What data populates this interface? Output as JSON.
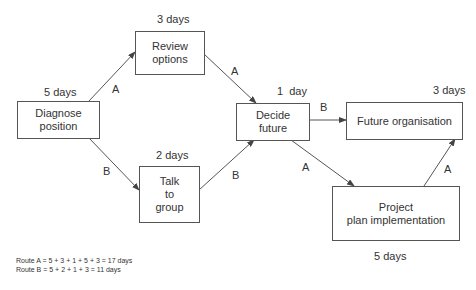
{
  "nodes": {
    "diagnose": {
      "label": "Diagnose\nposition",
      "line1": "Diagnose",
      "line2": "position",
      "duration": "5 days"
    },
    "review": {
      "label": "Review options",
      "line1": "Review",
      "line2": "options",
      "duration": "3 days"
    },
    "talk": {
      "label": "Talk to group",
      "line1": "Talk",
      "line2": "to",
      "line3": "group",
      "duration": "2 days"
    },
    "decide": {
      "label": "Decide future",
      "line1": "Decide",
      "line2": "future",
      "duration": "1  day"
    },
    "future_org": {
      "label": "Future organisation",
      "duration": "3 days"
    },
    "project": {
      "label": "Project plan implementation",
      "line1": "Project",
      "line2": "plan implementation",
      "duration": "5 days"
    }
  },
  "edges": [
    {
      "from": "diagnose",
      "to": "review",
      "route": "A"
    },
    {
      "from": "diagnose",
      "to": "talk",
      "route": "B"
    },
    {
      "from": "review",
      "to": "decide",
      "route": "A"
    },
    {
      "from": "talk",
      "to": "decide",
      "route": "B"
    },
    {
      "from": "decide",
      "to": "future_org",
      "route": "B"
    },
    {
      "from": "decide",
      "to": "project",
      "route": "A"
    },
    {
      "from": "project",
      "to": "future_org",
      "route": "A"
    }
  ],
  "edge_labels": {
    "a": "A",
    "b": "B"
  },
  "routes": {
    "route_a": "Route A = 5 + 3 + 1 + 5 + 3 = 17 days",
    "route_b": "Route B = 5 + 2 + 1 + 3 = 11 days"
  },
  "colors": {
    "line": "#555555",
    "text": "#333333",
    "background": "#ffffff"
  }
}
